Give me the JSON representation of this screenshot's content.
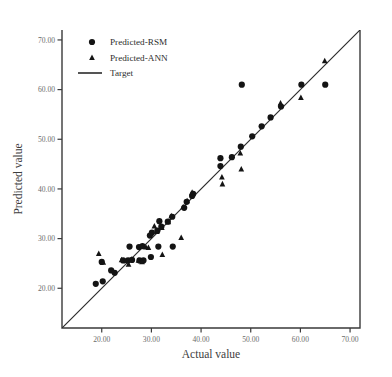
{
  "chart_data": {
    "type": "scatter",
    "title": "",
    "xlabel": "Actual value",
    "ylabel": "Predicted value",
    "xlim": [
      12.0,
      72.0
    ],
    "ylim": [
      12.0,
      72.0
    ],
    "xticks": [
      20,
      30,
      40,
      50,
      60,
      70
    ],
    "yticks": [
      20,
      30,
      40,
      50,
      60,
      70
    ],
    "xticklabels": [
      "20.00",
      "30.00",
      "40.00",
      "50.00",
      "60.00",
      "70.00"
    ],
    "yticklabels": [
      "20.00",
      "30.00",
      "40.00",
      "50.00",
      "60.00",
      "70.00"
    ],
    "grid": false,
    "legend_position": "top-left",
    "series": [
      {
        "name": "Predicted-RSM",
        "marker": "circle",
        "color": "#141414",
        "points": [
          [
            18.8,
            20.9
          ],
          [
            20.2,
            21.4
          ],
          [
            21.9,
            23.6
          ],
          [
            22.6,
            23.1
          ],
          [
            20.0,
            25.3
          ],
          [
            24.3,
            25.6
          ],
          [
            25.3,
            25.6
          ],
          [
            26.1,
            25.7
          ],
          [
            27.6,
            25.6
          ],
          [
            28.4,
            25.6
          ],
          [
            29.9,
            26.3
          ],
          [
            25.6,
            28.4
          ],
          [
            27.5,
            28.3
          ],
          [
            28.2,
            28.5
          ],
          [
            31.4,
            28.4
          ],
          [
            34.3,
            28.4
          ],
          [
            29.7,
            30.6
          ],
          [
            30.1,
            31.2
          ],
          [
            31.2,
            31.6
          ],
          [
            32.0,
            32.4
          ],
          [
            31.6,
            33.5
          ],
          [
            33.3,
            33.4
          ],
          [
            34.2,
            34.4
          ],
          [
            36.6,
            36.2
          ],
          [
            37.1,
            37.4
          ],
          [
            38.2,
            38.6
          ],
          [
            38.4,
            39.0
          ],
          [
            43.9,
            44.6
          ],
          [
            43.9,
            46.2
          ],
          [
            46.2,
            46.4
          ],
          [
            48.0,
            48.5
          ],
          [
            48.2,
            61.0
          ],
          [
            50.3,
            50.6
          ],
          [
            52.2,
            52.6
          ],
          [
            54.0,
            54.4
          ],
          [
            56.1,
            56.6
          ],
          [
            60.2,
            61.0
          ],
          [
            65.0,
            61.0
          ]
        ]
      },
      {
        "name": "Predicted-ANN",
        "marker": "triangle",
        "color": "#141414",
        "points": [
          [
            19.4,
            27.0
          ],
          [
            20.3,
            25.2
          ],
          [
            24.0,
            25.7
          ],
          [
            25.0,
            25.5
          ],
          [
            25.4,
            24.8
          ],
          [
            26.0,
            25.8
          ],
          [
            27.4,
            25.6
          ],
          [
            28.1,
            25.3
          ],
          [
            28.9,
            28.3
          ],
          [
            29.4,
            28.2
          ],
          [
            30.6,
            32.5
          ],
          [
            31.1,
            31.4
          ],
          [
            32.1,
            32.2
          ],
          [
            33.4,
            33.4
          ],
          [
            34.0,
            34.6
          ],
          [
            32.2,
            26.8
          ],
          [
            36.4,
            36.4
          ],
          [
            37.2,
            37.6
          ],
          [
            38.2,
            39.3
          ],
          [
            36.0,
            30.2
          ],
          [
            44.2,
            42.4
          ],
          [
            44.3,
            41.0
          ],
          [
            47.9,
            47.2
          ],
          [
            48.1,
            44.0
          ],
          [
            56.0,
            57.3
          ],
          [
            60.1,
            58.4
          ],
          [
            64.9,
            65.8
          ]
        ]
      }
    ],
    "reference_line": {
      "name": "Target",
      "from": [
        12.0,
        12.0
      ],
      "to": [
        72.0,
        72.0
      ]
    }
  },
  "legend": {
    "items": [
      {
        "label": "Predicted-RSM",
        "marker": "circle"
      },
      {
        "label": "Predicted-ANN",
        "marker": "triangle"
      },
      {
        "label": "Target",
        "marker": "line"
      }
    ]
  }
}
